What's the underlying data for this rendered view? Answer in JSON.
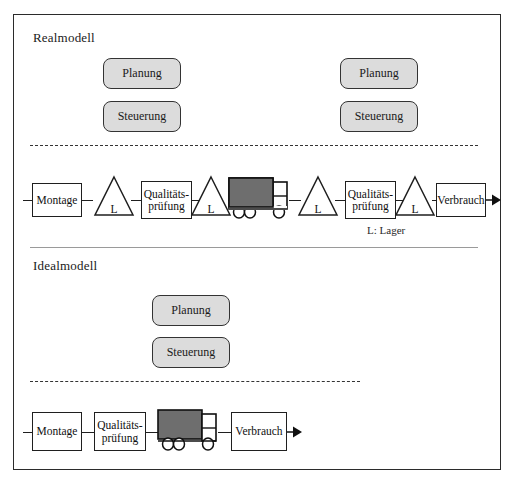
{
  "figure": {
    "frame_border_color": "#2b2b2b",
    "background": "#ffffff"
  },
  "sections": [
    {
      "id": "realmodell",
      "title": "Realmodell",
      "control_boxes_left": [
        {
          "label": "Planung"
        },
        {
          "label": "Steuerung"
        }
      ],
      "control_boxes_right": [
        {
          "label": "Planung"
        },
        {
          "label": "Steuerung"
        }
      ],
      "chain": [
        {
          "type": "box",
          "label": "Montage"
        },
        {
          "type": "triangle",
          "label": "L"
        },
        {
          "type": "box",
          "label_line1": "Qualitäts-",
          "label_line2": "prüfung"
        },
        {
          "type": "triangle",
          "label": "L"
        },
        {
          "type": "truck",
          "label": "truck-icon"
        },
        {
          "type": "triangle",
          "label": "L"
        },
        {
          "type": "box",
          "label_line1": "Qualitäts-",
          "label_line2": "prüfung"
        },
        {
          "type": "triangle",
          "label": "L"
        },
        {
          "type": "box",
          "label": "Verbrauch"
        },
        {
          "type": "arrow",
          "label": "arrow-right-icon"
        }
      ],
      "legend": "L: Lager"
    },
    {
      "id": "idealmodell",
      "title": "Idealmodell",
      "control_boxes_center": [
        {
          "label": "Planung"
        },
        {
          "label": "Steuerung"
        }
      ],
      "chain": [
        {
          "type": "box",
          "label": "Montage"
        },
        {
          "type": "box",
          "label_line1": "Qualitäts-",
          "label_line2": "prüfung"
        },
        {
          "type": "truck",
          "label": "truck-icon"
        },
        {
          "type": "box",
          "label": "Verbrauch"
        },
        {
          "type": "arrow",
          "label": "arrow-right-icon"
        }
      ]
    }
  ],
  "colors": {
    "control_box_fill": "#dcdcdc",
    "control_box_border": "#333333",
    "process_box_border": "#1f1f1f",
    "truck_body_fill": "#6e6e6e",
    "truck_outline": "#101010",
    "line": "#1f1f1f",
    "dashed_line": "#333333",
    "solid_divider": "#9a9a9a"
  }
}
